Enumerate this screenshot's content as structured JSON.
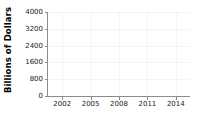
{
  "chart_data": {
    "type": "line",
    "title": "",
    "xlabel": "",
    "ylabel": "Billions of Dollars",
    "xlim": [
      2000.5,
      2015.5
    ],
    "ylim": [
      0,
      4000
    ],
    "grid": true,
    "legend": null,
    "series": [],
    "x": [],
    "yticks": [
      {
        "value": 0,
        "label": "0"
      },
      {
        "value": 800,
        "label": "800"
      },
      {
        "value": 1600,
        "label": "1600"
      },
      {
        "value": 2400,
        "label": "2400"
      },
      {
        "value": 3200,
        "label": "3200"
      },
      {
        "value": 4000,
        "label": "4000"
      }
    ],
    "xticks": [
      {
        "value": 2002,
        "label": "2002"
      },
      {
        "value": 2005,
        "label": "2005"
      },
      {
        "value": 2008,
        "label": "2008"
      },
      {
        "value": 2011,
        "label": "2011"
      },
      {
        "value": 2014,
        "label": "2014"
      }
    ],
    "colors": {
      "background": "#ffffff",
      "axis": "#8c8c8c",
      "grid": "#f4f4f4",
      "text": "#1a1a1a"
    }
  }
}
